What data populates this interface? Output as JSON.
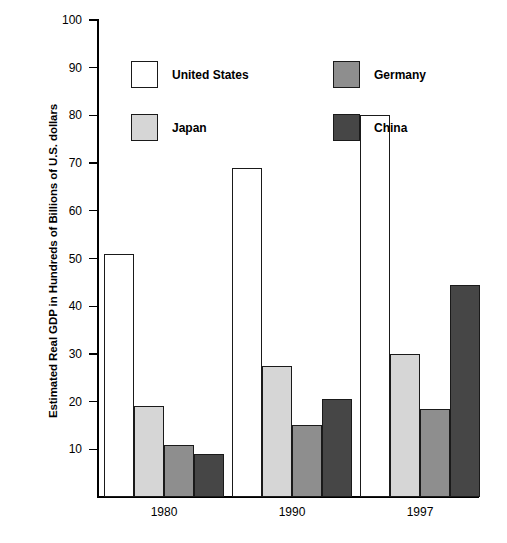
{
  "chart_data": {
    "type": "bar",
    "title": "",
    "xlabel": "",
    "ylabel": "Estimated Real GDP in Hundreds of Billions of U.S. dollars",
    "categories": [
      "1980",
      "1990",
      "1997"
    ],
    "ylim": [
      0,
      100
    ],
    "yticks": [
      10,
      20,
      30,
      40,
      50,
      60,
      70,
      80,
      90,
      100
    ],
    "ytick_labels": [
      "10",
      "20",
      "30",
      "40",
      "50",
      "60",
      "70",
      "80",
      "90",
      "100"
    ],
    "grid": false,
    "legend_position": "upper-center-split",
    "series": [
      {
        "name": "United States",
        "color": "#ffffff",
        "values": [
          51,
          69,
          80
        ]
      },
      {
        "name": "Japan",
        "color": "#d6d6d6",
        "values": [
          19,
          27.5,
          30
        ]
      },
      {
        "name": "Germany",
        "color": "#8e8e8e",
        "values": [
          11,
          15,
          18.5
        ]
      },
      {
        "name": "China",
        "color": "#464646",
        "values": [
          9,
          20.5,
          44.5
        ]
      }
    ]
  },
  "legend": {
    "items": [
      {
        "label": "United States",
        "color": "#ffffff"
      },
      {
        "label": "Japan",
        "color": "#d6d6d6"
      },
      {
        "label": "Germany",
        "color": "#8e8e8e"
      },
      {
        "label": "China",
        "color": "#464646"
      }
    ]
  },
  "axes": {
    "y_title": "Estimated Real GDP in Hundreds of Billions of U.S. dollars",
    "y_ticks": [
      "100",
      "90",
      "80",
      "70",
      "60",
      "50",
      "40",
      "30",
      "20",
      "10"
    ],
    "x_ticks": [
      "1980",
      "1990",
      "1997"
    ]
  }
}
